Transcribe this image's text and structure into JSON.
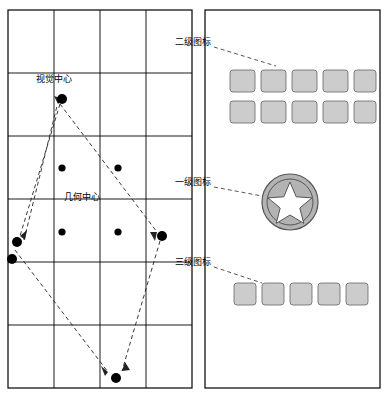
{
  "diagram": {
    "title": "",
    "left_panel": {
      "name": "grid-layout-panel",
      "grid": {
        "cols": 4,
        "rows": 6,
        "x": 8,
        "y": 10,
        "w": 184,
        "h": 378
      },
      "labels": [
        {
          "id": "visual-center",
          "text": "视觉中心",
          "x": 36,
          "y": 78
        },
        {
          "id": "geometric-center",
          "text": "几何中心",
          "x": 62,
          "y": 196
        }
      ],
      "points": [
        {
          "id": "visual-center-dot",
          "cx": 62,
          "cy": 99,
          "r": 5
        },
        {
          "id": "mid-left-dot",
          "cx": 62,
          "cy": 168,
          "r": 4
        },
        {
          "id": "mid-right-dot",
          "cx": 118,
          "cy": 168,
          "r": 4
        },
        {
          "id": "geometric-center-dot",
          "cx": 62,
          "cy": 232,
          "r": 4
        },
        {
          "id": "center-right-dot",
          "cx": 118,
          "cy": 232,
          "r": 4
        },
        {
          "id": "right-dot",
          "cx": 162,
          "cy": 236,
          "r": 5
        },
        {
          "id": "left-dot-upper",
          "cx": 17,
          "cy": 242,
          "r": 5
        },
        {
          "id": "left-dot-lower",
          "cx": 12,
          "cy": 259,
          "r": 5
        },
        {
          "id": "bottom-dot",
          "cx": 116,
          "cy": 378,
          "r": 5
        }
      ]
    },
    "right_panel": {
      "name": "icon-hierarchy-panel",
      "frame": {
        "x": 205,
        "y": 10,
        "w": 175,
        "h": 378
      },
      "level2": {
        "rows": 2,
        "cols": 5,
        "x": 230,
        "y": 70,
        "cell_w": 25,
        "cell_h": 22,
        "gap_x": 6,
        "gap_y": 9
      },
      "level1": {
        "cx": 290,
        "cy": 202,
        "r": 28,
        "shape": "star-in-circle"
      },
      "level3": {
        "rows": 1,
        "cols": 5,
        "x": 234,
        "y": 283,
        "cell_w": 22,
        "cell_h": 22,
        "gap_x": 6
      }
    },
    "annotations": [
      {
        "id": "level2-label",
        "text": "二级图标",
        "x": 177,
        "y": 41
      },
      {
        "id": "level1-label",
        "text": "一级图标",
        "x": 177,
        "y": 181
      },
      {
        "id": "level3-label",
        "text": "三级图标",
        "x": 177,
        "y": 261
      }
    ],
    "colors": {
      "stroke": "#000000",
      "icon_fill": "#cccccc",
      "icon_stroke": "#666666",
      "dot_fill": "#000000",
      "dashed": "#333333",
      "panel_bg": "#ffffff"
    }
  }
}
